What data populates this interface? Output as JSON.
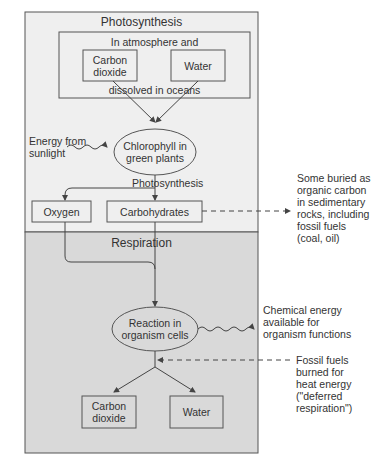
{
  "colors": {
    "photosynthesis_bg": "#efefef",
    "respiration_bg": "#d9d9d9",
    "border": "#555555",
    "page_bg": "#ffffff"
  },
  "photosynthesis": {
    "title": "Photosynthesis",
    "source_box": {
      "top_label": "In atmosphere and",
      "bottom_label": "dissolved in oceans",
      "items": [
        {
          "line1": "Carbon",
          "line2": "dioxide"
        },
        {
          "line1": "Water"
        }
      ]
    },
    "energy_input": {
      "line1": "Energy from",
      "line2": "sunlight"
    },
    "chlorophyll": {
      "line1": "Chlorophyll in",
      "line2": "green plants"
    },
    "process_label": "Photosynthesis",
    "products": [
      {
        "label": "Oxygen"
      },
      {
        "label": "Carbohydrates"
      }
    ]
  },
  "respiration": {
    "title": "Respiration",
    "reaction": {
      "line1": "Reaction in",
      "line2": "organism cells"
    },
    "products": [
      {
        "line1": "Carbon",
        "line2": "dioxide"
      },
      {
        "line1": "Water"
      }
    ]
  },
  "side_notes": {
    "buried": [
      "Some buried as",
      "organic carbon",
      "in sedimentary",
      "rocks, including",
      "fossil fuels",
      "(coal, oil)"
    ],
    "chemical_energy": [
      "Chemical energy",
      "available for",
      "organism functions"
    ],
    "fossil_burned": [
      "Fossil fuels",
      "burned for",
      "heat energy",
      "(\"deferred",
      "respiration\")"
    ]
  }
}
